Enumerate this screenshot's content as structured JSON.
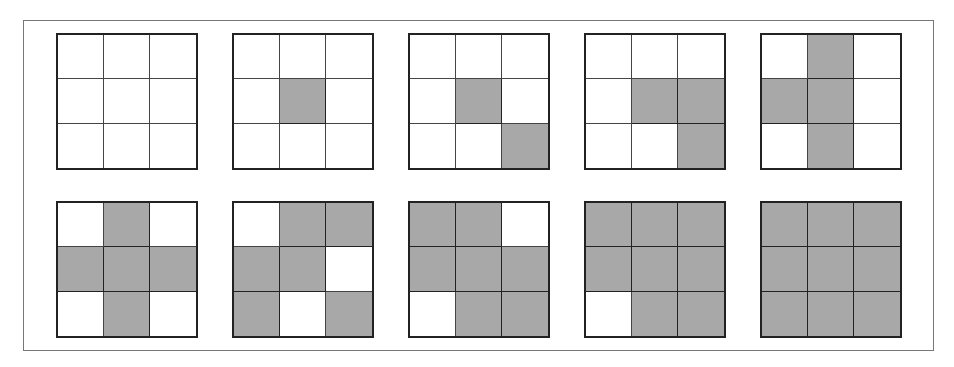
{
  "diagram": {
    "fill_color": "#a8a8a8",
    "empty_color": "#ffffff",
    "grids": [
      {
        "row": 0,
        "col": 0,
        "cells": [
          0,
          0,
          0,
          0,
          0,
          0,
          0,
          0,
          0
        ]
      },
      {
        "row": 0,
        "col": 1,
        "cells": [
          0,
          0,
          0,
          0,
          1,
          0,
          0,
          0,
          0
        ]
      },
      {
        "row": 0,
        "col": 2,
        "cells": [
          0,
          0,
          0,
          0,
          1,
          0,
          0,
          0,
          1
        ]
      },
      {
        "row": 0,
        "col": 3,
        "cells": [
          0,
          0,
          0,
          0,
          1,
          1,
          0,
          0,
          1
        ]
      },
      {
        "row": 0,
        "col": 4,
        "cells": [
          0,
          1,
          0,
          1,
          1,
          0,
          0,
          1,
          0
        ]
      },
      {
        "row": 1,
        "col": 0,
        "cells": [
          0,
          1,
          0,
          1,
          1,
          1,
          0,
          1,
          0
        ]
      },
      {
        "row": 1,
        "col": 1,
        "cells": [
          0,
          1,
          1,
          1,
          1,
          0,
          1,
          0,
          1
        ]
      },
      {
        "row": 1,
        "col": 2,
        "cells": [
          1,
          1,
          0,
          1,
          1,
          1,
          0,
          1,
          1
        ]
      },
      {
        "row": 1,
        "col": 3,
        "cells": [
          1,
          1,
          1,
          1,
          1,
          1,
          0,
          1,
          1
        ]
      },
      {
        "row": 1,
        "col": 4,
        "cells": [
          1,
          1,
          1,
          1,
          1,
          1,
          1,
          1,
          1
        ]
      }
    ]
  }
}
